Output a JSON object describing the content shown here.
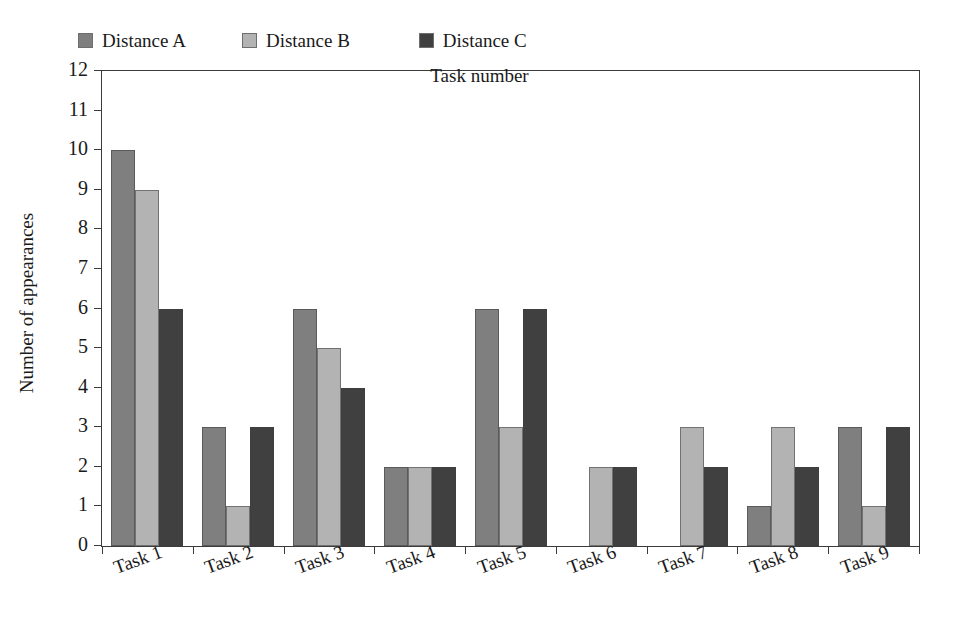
{
  "chart_data": {
    "type": "bar",
    "title": "",
    "subtitle": "",
    "xlabel": "Task number",
    "ylabel": "Number of appearances",
    "categories": [
      "Task 1",
      "Task 2",
      "Task 3",
      "Task 4",
      "Task 5",
      "Task 6",
      "Task 7",
      "Task 8",
      "Task 9"
    ],
    "series": [
      {
        "name": "Distance A",
        "color": "#7f7f7f",
        "values": [
          10,
          3,
          6,
          2,
          6,
          0,
          0,
          1,
          3
        ]
      },
      {
        "name": "Distance B",
        "color": "#b3b3b3",
        "values": [
          9,
          1,
          5,
          2,
          3,
          2,
          3,
          3,
          1
        ]
      },
      {
        "name": "Distance C",
        "color": "#404040",
        "values": [
          6,
          3,
          4,
          2,
          6,
          2,
          2,
          2,
          3
        ]
      }
    ],
    "ylim": [
      0,
      12
    ],
    "ytick_labels": [
      "0",
      "1",
      "2",
      "3",
      "4",
      "5",
      "6",
      "7",
      "8",
      "9",
      "10",
      "11",
      "12"
    ],
    "ytick_values": [
      0,
      1,
      2,
      3,
      4,
      5,
      6,
      7,
      8,
      9,
      10,
      11,
      12
    ],
    "grid": false,
    "legend_position": "top-left",
    "frame": true,
    "background_color": "#ffffff",
    "axis_color": "#3b3b3b"
  },
  "legend": {
    "entries": [
      {
        "label": "Distance A"
      },
      {
        "label": "Distance B"
      },
      {
        "label": "Distance C"
      }
    ]
  },
  "axes": {
    "y_title": "Number of appearances",
    "x_title": "Task number"
  }
}
